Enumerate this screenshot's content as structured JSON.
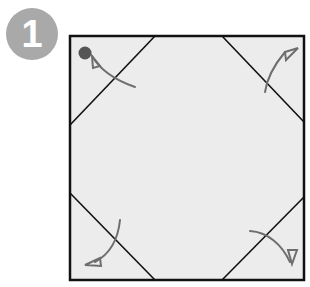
{
  "step": {
    "number": "1"
  },
  "diagram": {
    "paper_color": "#ececec",
    "line_color": "#111111",
    "arrow_color": "#6e6e6e",
    "marker_color": "#555555",
    "folds": [
      "top-left-corner",
      "top-right-corner",
      "bottom-left-corner",
      "bottom-right-corner"
    ]
  }
}
